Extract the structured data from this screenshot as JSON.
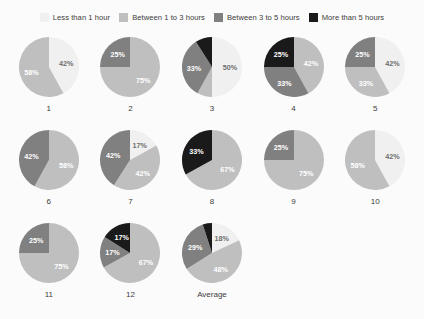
{
  "palette": {
    "less_1h": "#f0f0f0",
    "between_1_3h": "#bfbfbf",
    "between_3_5h": "#808080",
    "more_5h": "#1a1a1a",
    "background": "#fbfbfb",
    "text": "#3b3b3b",
    "label_on_light": "#595959",
    "label_on_white": "#6e6e6e"
  },
  "legend": {
    "items": [
      {
        "label": "Less than 1 hour",
        "color": "#f0f0f0",
        "key": "less_1h"
      },
      {
        "label": "Between 1 to 3 hours",
        "color": "#bfbfbf",
        "key": "between_1_3h"
      },
      {
        "label": "Between 3 to 5 hours",
        "color": "#808080",
        "key": "between_3_5h"
      },
      {
        "label": "More than 5 hours",
        "color": "#1a1a1a",
        "key": "more_5h"
      }
    ]
  },
  "chart_data": {
    "type": "pie",
    "title": "",
    "legend_position": "top",
    "categories": [
      "Less than 1 hour",
      "Between 1 to 3 hours",
      "Between 3 to 5 hours",
      "More than 5 hours"
    ],
    "units": "percent",
    "charts": [
      {
        "caption": "1",
        "start_angle": 0,
        "slices": [
          {
            "category": "Less than 1 hour",
            "value": 42,
            "label": "42%"
          },
          {
            "category": "Between 1 to 3 hours",
            "value": 58,
            "label": "58%"
          }
        ]
      },
      {
        "caption": "2",
        "start_angle": 0,
        "slices": [
          {
            "category": "Between 1 to 3 hours",
            "value": 75,
            "label": "75%"
          },
          {
            "category": "Between 3 to 5 hours",
            "value": 25,
            "label": "25%"
          }
        ]
      },
      {
        "caption": "3",
        "start_angle": 0,
        "slices": [
          {
            "category": "Less than 1 hour",
            "value": 50,
            "label": "50%"
          },
          {
            "category": "Between 1 to 3 hours",
            "value": 8,
            "label": ""
          },
          {
            "category": "Between 3 to 5 hours",
            "value": 33,
            "label": "33%"
          },
          {
            "category": "More than 5 hours",
            "value": 9,
            "label": ""
          }
        ]
      },
      {
        "caption": "4",
        "start_angle": 0,
        "slices": [
          {
            "category": "Between 1 to 3 hours",
            "value": 42,
            "label": "42%"
          },
          {
            "category": "Between 3 to 5 hours",
            "value": 33,
            "label": "33%"
          },
          {
            "category": "More than 5 hours",
            "value": 25,
            "label": "25%"
          }
        ]
      },
      {
        "caption": "5",
        "start_angle": 0,
        "slices": [
          {
            "category": "Less than 1 hour",
            "value": 42,
            "label": "42%"
          },
          {
            "category": "Between 1 to 3 hours",
            "value": 33,
            "label": "33%"
          },
          {
            "category": "Between 3 to 5 hours",
            "value": 25,
            "label": "25%"
          }
        ]
      },
      {
        "caption": "6",
        "start_angle": 0,
        "slices": [
          {
            "category": "Between 1 to 3 hours",
            "value": 58,
            "label": "58%"
          },
          {
            "category": "Between 3 to 5 hours",
            "value": 42,
            "label": "42%"
          }
        ]
      },
      {
        "caption": "7",
        "start_angle": 0,
        "slices": [
          {
            "category": "Less than 1 hour",
            "value": 17,
            "label": "17%"
          },
          {
            "category": "Between 1 to 3 hours",
            "value": 42,
            "label": "42%"
          },
          {
            "category": "Between 3 to 5 hours",
            "value": 41,
            "label": "42%"
          }
        ]
      },
      {
        "caption": "8",
        "start_angle": 0,
        "slices": [
          {
            "category": "Between 1 to 3 hours",
            "value": 67,
            "label": "67%"
          },
          {
            "category": "More than 5 hours",
            "value": 33,
            "label": "33%"
          }
        ]
      },
      {
        "caption": "9",
        "start_angle": 0,
        "slices": [
          {
            "category": "Between 1 to 3 hours",
            "value": 75,
            "label": "75%"
          },
          {
            "category": "Between 3 to 5 hours",
            "value": 25,
            "label": "25%"
          }
        ]
      },
      {
        "caption": "10",
        "start_angle": 0,
        "slices": [
          {
            "category": "Less than 1 hour",
            "value": 42,
            "label": "42%"
          },
          {
            "category": "Between 1 to 3 hours",
            "value": 58,
            "label": "58%"
          }
        ]
      },
      {
        "caption": "11",
        "start_angle": 0,
        "slices": [
          {
            "category": "Between 1 to 3 hours",
            "value": 75,
            "label": "75%"
          },
          {
            "category": "Between 3 to 5 hours",
            "value": 25,
            "label": "25%"
          }
        ]
      },
      {
        "caption": "12",
        "start_angle": 0,
        "slices": [
          {
            "category": "Between 1 to 3 hours",
            "value": 67,
            "label": "67%"
          },
          {
            "category": "Between 3 to 5 hours",
            "value": 17,
            "label": "17%"
          },
          {
            "category": "More than 5 hours",
            "value": 16,
            "label": "17%"
          }
        ]
      },
      {
        "caption": "Average",
        "start_angle": 0,
        "slices": [
          {
            "category": "Less than 1 hour",
            "value": 18,
            "label": "18%"
          },
          {
            "category": "Between 1 to 3 hours",
            "value": 48,
            "label": "48%"
          },
          {
            "category": "Between 3 to 5 hours",
            "value": 29,
            "label": "29%"
          },
          {
            "category": "More than 5 hours",
            "value": 5,
            "label": ""
          }
        ]
      }
    ]
  }
}
